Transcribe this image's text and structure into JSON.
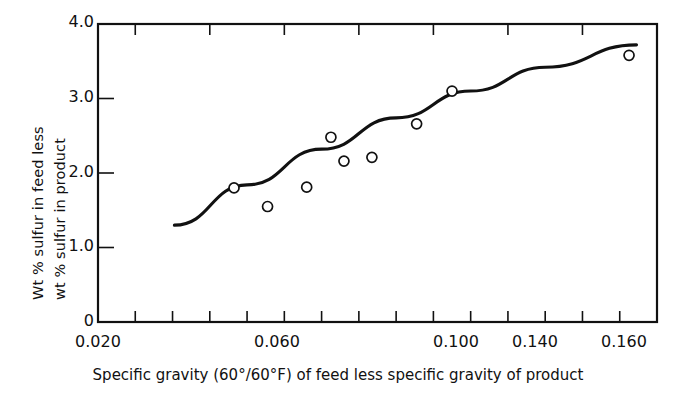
{
  "chart_data": {
    "type": "scatter",
    "title": "",
    "xlabel": "Specific gravity (60°/60°F) of feed less specific gravity of product",
    "ylabel_line1": "Wt % sulfur in feed less",
    "ylabel_line2": "wt % sulfur in product",
    "xlim": [
      0.02,
      0.17
    ],
    "ylim": [
      0,
      4.0
    ],
    "grid": false,
    "legend": null,
    "x_ticklabels": [
      "0.020",
      "0.060",
      "0.100",
      "0.140",
      "0.160"
    ],
    "x_ticklabel_values": [
      0.02,
      0.06,
      0.1,
      0.14,
      0.16
    ],
    "x_minor_tick_values": [
      0.03,
      0.04,
      0.05,
      0.06,
      0.07,
      0.08,
      0.09,
      0.1,
      0.11,
      0.12,
      0.13,
      0.14,
      0.15,
      0.16
    ],
    "y_ticklabels": [
      "0",
      "1.0",
      "2.0",
      "3.0",
      "4.0"
    ],
    "y_ticklabel_values": [
      0,
      1.0,
      2.0,
      3.0,
      4.0
    ],
    "top_minor_tick_values": [
      0.03,
      0.05,
      0.07,
      0.09,
      0.11,
      0.13,
      0.15,
      0.17
    ],
    "points": [
      {
        "x": 0.0565,
        "y": 1.8
      },
      {
        "x": 0.0655,
        "y": 1.55
      },
      {
        "x": 0.076,
        "y": 1.81
      },
      {
        "x": 0.0825,
        "y": 2.48
      },
      {
        "x": 0.086,
        "y": 2.16
      },
      {
        "x": 0.0935,
        "y": 2.21
      },
      {
        "x": 0.1055,
        "y": 2.66
      },
      {
        "x": 0.115,
        "y": 3.1
      },
      {
        "x": 0.1625,
        "y": 3.58
      }
    ],
    "fit_curve": {
      "name": "trend line",
      "x": [
        0.0405,
        0.06,
        0.08,
        0.1,
        0.12,
        0.14,
        0.1645
      ],
      "y": [
        1.3,
        1.84,
        2.32,
        2.74,
        3.1,
        3.42,
        3.72
      ]
    }
  },
  "axes": {
    "y_ticks": [
      {
        "label": "4.0",
        "value": 4.0
      },
      {
        "label": "3.0",
        "value": 3.0
      },
      {
        "label": "2.0",
        "value": 2.0
      },
      {
        "label": "1.0",
        "value": 1.0
      },
      {
        "label": "0",
        "value": 0.0
      }
    ],
    "x_ticks": [
      {
        "label": "0.020",
        "value": 0.02
      },
      {
        "label": "0.060",
        "value": 0.06
      },
      {
        "label": "0.100",
        "value": 0.1
      },
      {
        "label": "0.140",
        "value": 0.14
      },
      {
        "label": "0.160",
        "value": 0.16
      }
    ]
  }
}
